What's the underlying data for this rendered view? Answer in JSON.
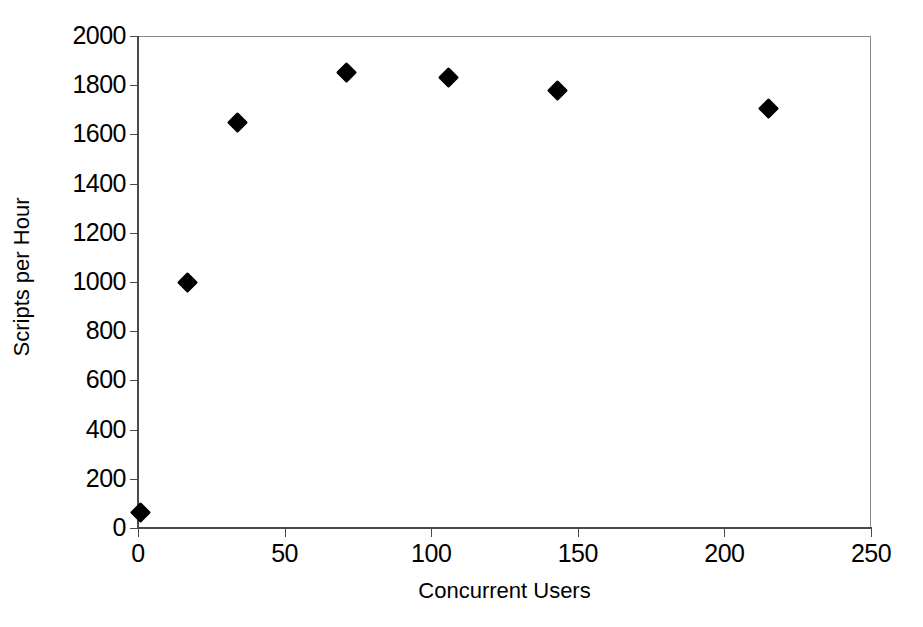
{
  "chart_data": {
    "type": "scatter",
    "title": "",
    "xlabel": "Concurrent Users",
    "ylabel": "Scripts per Hour",
    "xlim": [
      0,
      250
    ],
    "ylim": [
      0,
      2000
    ],
    "xticks": [
      0,
      50,
      100,
      150,
      200,
      250
    ],
    "yticks": [
      0,
      200,
      400,
      600,
      800,
      1000,
      1200,
      1400,
      1600,
      1800,
      2000
    ],
    "xtick_labels": [
      "0",
      "50",
      "100",
      "150",
      "200",
      "250"
    ],
    "ytick_labels": [
      "0",
      "200",
      "400",
      "600",
      "800",
      "1000",
      "1200",
      "1400",
      "1600",
      "1800",
      "2000"
    ],
    "grid": false,
    "legend": "none",
    "marker": "filled-diamond",
    "marker_color": "#000000",
    "frame_color": "#8a8a8a",
    "background": "#ffffff",
    "series": [
      {
        "name": "Scripts per Hour",
        "x": [
          1,
          17,
          34,
          71,
          106,
          143,
          215
        ],
        "y": [
          65,
          1000,
          1650,
          1850,
          1830,
          1780,
          1705
        ]
      }
    ],
    "points": [
      {
        "x": 1,
        "y": 65,
        "label": "(1, 65)"
      },
      {
        "x": 17,
        "y": 1000,
        "label": "(17, 1000)"
      },
      {
        "x": 34,
        "y": 1650,
        "label": "(34, 1650)"
      },
      {
        "x": 71,
        "y": 1850,
        "label": "(71, 1850)"
      },
      {
        "x": 106,
        "y": 1830,
        "label": "(106, 1830)"
      },
      {
        "x": 143,
        "y": 1780,
        "label": "(143, 1780)"
      },
      {
        "x": 215,
        "y": 1705,
        "label": "(215, 1705)"
      }
    ]
  }
}
